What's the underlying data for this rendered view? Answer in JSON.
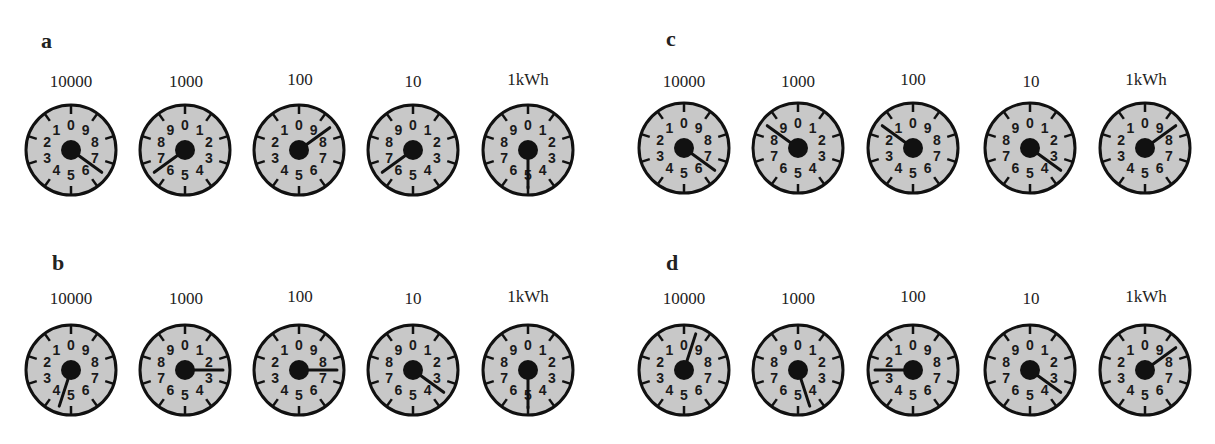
{
  "figure": {
    "panels": [
      {
        "id": "a",
        "label": "a",
        "dials": [
          {
            "unit": "10000",
            "direction": "ccw",
            "reading": 6.5
          },
          {
            "unit": "1000",
            "direction": "cw",
            "reading": 6.5
          },
          {
            "unit": "100",
            "direction": "ccw",
            "reading": 8.5
          },
          {
            "unit": "10",
            "direction": "cw",
            "reading": 6.5
          },
          {
            "unit": "1kWh",
            "direction": "cw",
            "reading": 5
          }
        ]
      },
      {
        "id": "b",
        "label": "b",
        "dials": [
          {
            "unit": "10000",
            "direction": "ccw",
            "reading": 4.5
          },
          {
            "unit": "1000",
            "direction": "cw",
            "reading": 2.5
          },
          {
            "unit": "100",
            "direction": "ccw",
            "reading": 7.5
          },
          {
            "unit": "10",
            "direction": "cw",
            "reading": 3.5
          },
          {
            "unit": "1kWh",
            "direction": "cw",
            "reading": 5
          }
        ]
      },
      {
        "id": "c",
        "label": "c",
        "dials": [
          {
            "unit": "10000",
            "direction": "ccw",
            "reading": 6.5
          },
          {
            "unit": "1000",
            "direction": "cw",
            "reading": 8.5
          },
          {
            "unit": "100",
            "direction": "ccw",
            "reading": 1.5
          },
          {
            "unit": "10",
            "direction": "cw",
            "reading": 3.5
          },
          {
            "unit": "1kWh",
            "direction": "ccw",
            "reading": 8.5
          }
        ]
      },
      {
        "id": "d",
        "label": "d",
        "dials": [
          {
            "unit": "10000",
            "direction": "ccw",
            "reading": 9.5
          },
          {
            "unit": "1000",
            "direction": "cw",
            "reading": 4.5
          },
          {
            "unit": "100",
            "direction": "ccw",
            "reading": 2.5
          },
          {
            "unit": "10",
            "direction": "cw",
            "reading": 3.5
          },
          {
            "unit": "1kWh",
            "direction": "ccw",
            "reading": 8.5
          }
        ]
      }
    ],
    "colors": {
      "dial_face": "#c8c8c8",
      "ink": "#111111",
      "background": "#ffffff"
    }
  }
}
